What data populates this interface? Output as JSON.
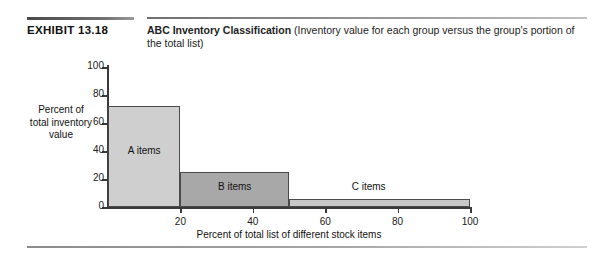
{
  "header": {
    "exhibit_number": "EXHIBIT 13.18",
    "caption_title": "ABC Inventory Classification",
    "caption_subtitle": "(Inventory value for each group versus the group's portion of the total list)"
  },
  "chart_data": {
    "type": "bar",
    "title": "ABC Inventory Classification",
    "xlabel": "Percent of total list of different stock items",
    "ylabel": "Percent of total inventory value",
    "xlim": [
      0,
      100
    ],
    "ylim": [
      0,
      100
    ],
    "grid": false,
    "legend": "none",
    "x_ticks": [
      0,
      20,
      40,
      60,
      80,
      100
    ],
    "x_tick_labels": [
      "0",
      "20",
      "40",
      "60",
      "80",
      "100"
    ],
    "y_ticks": [
      0,
      20,
      40,
      60,
      80,
      100
    ],
    "y_tick_labels": [
      "0",
      "20",
      "40",
      "60",
      "80",
      "100"
    ],
    "categories": [
      "A items",
      "B items",
      "C items"
    ],
    "values": [
      72,
      25,
      6
    ],
    "bars": [
      {
        "label": "A items",
        "x_start": 0,
        "x_end": 20,
        "value": 72,
        "color": "#cfcfcf"
      },
      {
        "label": "B items",
        "x_start": 20,
        "x_end": 50,
        "value": 25,
        "color": "#a8a8a8"
      },
      {
        "label": "C items",
        "x_start": 50,
        "x_end": 100,
        "value": 6,
        "color": "#c8c8c8"
      }
    ],
    "annotations": [
      {
        "text": "A items",
        "x": 10,
        "y": 40
      },
      {
        "text": "B items",
        "x": 35,
        "y": 14
      },
      {
        "text": "C items",
        "x": 72,
        "y": 14
      }
    ]
  }
}
